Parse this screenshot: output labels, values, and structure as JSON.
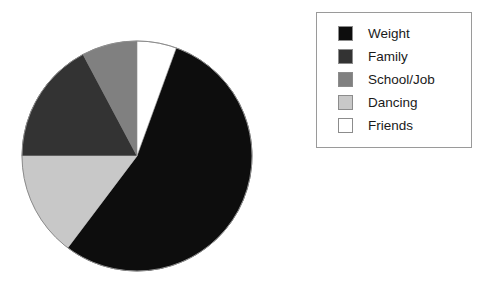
{
  "chart_data": {
    "type": "pie",
    "title": "",
    "subtitle": "",
    "xlabel": "",
    "ylabel": "",
    "grid": false,
    "legend_position": "right",
    "start_angle_deg": 0,
    "direction": "clockwise",
    "categories": [
      "Weight",
      "Family",
      "School/Job",
      "Dancing",
      "Friends"
    ],
    "values": [
      55,
      17,
      8,
      15,
      5
    ],
    "value_unit": "percent",
    "slices": [
      {
        "label": "Weight",
        "value": 55,
        "color": "#0d0d0d",
        "start_deg": 20,
        "end_deg": 217
      },
      {
        "label": "Family",
        "value": 17,
        "color": "#333333",
        "start_deg": 270,
        "end_deg": 332
      },
      {
        "label": "School/Job",
        "value": 8,
        "color": "#808080",
        "start_deg": 332,
        "end_deg": 360
      },
      {
        "label": "Dancing",
        "value": 15,
        "color": "#c8c8c8",
        "start_deg": 217,
        "end_deg": 270
      },
      {
        "label": "Friends",
        "value": 5,
        "color": "#ffffff",
        "start_deg": 0,
        "end_deg": 20
      }
    ]
  },
  "pie": {
    "center_x": 116,
    "center_y": 116,
    "radius": 115,
    "outline_color": "#8c8c8c"
  },
  "legend": {
    "border_color": "#9a9a9a",
    "background": "#ffffff",
    "items": [
      {
        "label": "Weight",
        "color": "#0d0d0d"
      },
      {
        "label": "Family",
        "color": "#333333"
      },
      {
        "label": "School/Job",
        "color": "#808080"
      },
      {
        "label": "Dancing",
        "color": "#c8c8c8"
      },
      {
        "label": "Friends",
        "color": "#ffffff"
      }
    ]
  }
}
